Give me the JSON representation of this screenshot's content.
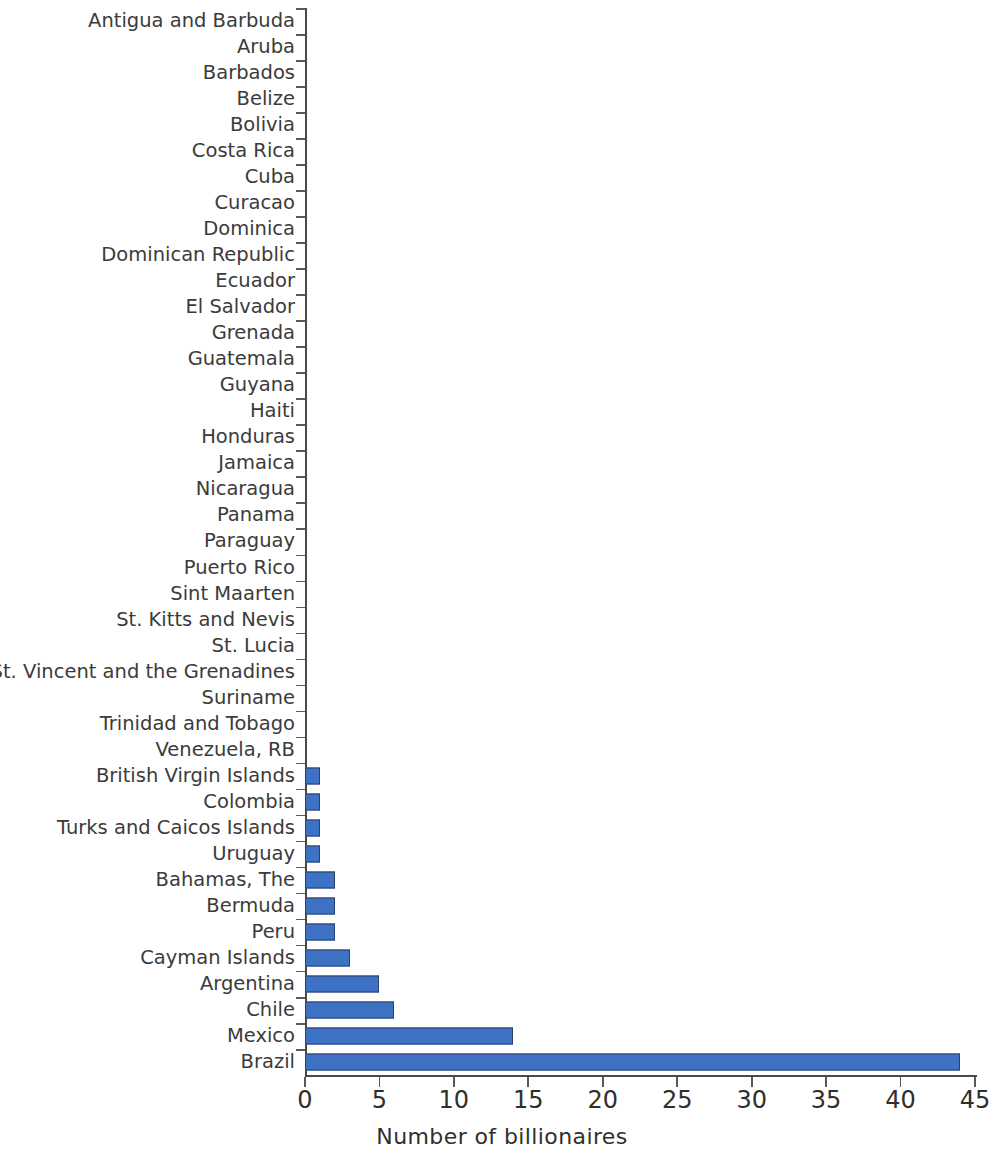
{
  "chart_data": {
    "type": "bar",
    "orientation": "horizontal",
    "title": "",
    "xlabel": "Number of billionaires",
    "ylabel": "",
    "xlim": [
      0,
      45
    ],
    "xticks": [
      0,
      5,
      10,
      15,
      20,
      25,
      30,
      35,
      40,
      45
    ],
    "grid": false,
    "legend": null,
    "bar_color": "#3e72c4",
    "bar_edge_color": "#2b3f6b",
    "categories": [
      "Antigua and Barbuda",
      "Aruba",
      "Barbados",
      "Belize",
      "Bolivia",
      "Costa Rica",
      "Cuba",
      "Curacao",
      "Dominica",
      "Dominican Republic",
      "Ecuador",
      "El Salvador",
      "Grenada",
      "Guatemala",
      "Guyana",
      "Haiti",
      "Honduras",
      "Jamaica",
      "Nicaragua",
      "Panama",
      "Paraguay",
      "Puerto Rico",
      "Sint Maarten",
      "St. Kitts and Nevis",
      "St. Lucia",
      "St. Vincent and the Grenadines",
      "Suriname",
      "Trinidad and Tobago",
      "Venezuela, RB",
      "British Virgin Islands",
      "Colombia",
      "Turks and Caicos Islands",
      "Uruguay",
      "Bahamas, The",
      "Bermuda",
      "Peru",
      "Cayman Islands",
      "Argentina",
      "Chile",
      "Mexico",
      "Brazil"
    ],
    "values": [
      0,
      0,
      0,
      0,
      0,
      0,
      0,
      0,
      0,
      0,
      0,
      0,
      0,
      0,
      0,
      0,
      0,
      0,
      0,
      0,
      0,
      0,
      0,
      0,
      0,
      0,
      0,
      0,
      0,
      1,
      1,
      1,
      1,
      2,
      2,
      2,
      3,
      5,
      6,
      14,
      44
    ]
  }
}
